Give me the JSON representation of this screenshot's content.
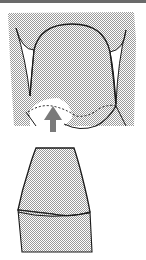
{
  "figure": {
    "type": "dental-illustration",
    "panels": [
      {
        "name": "upper-view",
        "description": "Tooth crown between gingiva with dashed margin and upward arrow"
      },
      {
        "name": "lower-view",
        "description": "Side profile of tooth crown over root section"
      }
    ],
    "colors": {
      "stipple": "#b8b8b8",
      "outline": "#1a1a1a",
      "arrow": "#7a7a7a",
      "topbar": "#6a6a6a",
      "background": "#ffffff"
    },
    "arrow": {
      "direction": "up"
    }
  }
}
